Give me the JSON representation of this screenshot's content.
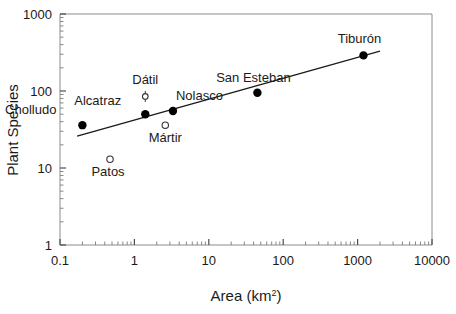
{
  "chart_data": {
    "type": "scatter",
    "title": "",
    "xlabel": "Area (km²)",
    "ylabel": "Plant Species",
    "xscale": "log",
    "yscale": "log",
    "xlim": [
      0.1,
      10000
    ],
    "ylim": [
      1,
      1000
    ],
    "xticks": [
      "0.1",
      "1",
      "10",
      "100",
      "1000",
      "10000"
    ],
    "yticks": [
      "1",
      "10",
      "100",
      "1000"
    ],
    "grid": false,
    "legend": "none",
    "points": [
      {
        "label": "Cholludo",
        "x": 0.2,
        "y": 36,
        "marker": "filled",
        "label_dx": -26,
        "label_dy": -11
      },
      {
        "label": "Patos",
        "x": 0.47,
        "y": 13,
        "marker": "open",
        "label_dx": -2,
        "label_dy": 17
      },
      {
        "label": "Dátil",
        "x": 1.4,
        "y": 85,
        "marker": "open-errorbar",
        "label_dx": 0,
        "label_dy": -12
      },
      {
        "label": "Alcatraz",
        "x": 1.4,
        "y": 50,
        "marker": "filled",
        "label_dx": -24,
        "label_dy": -9
      },
      {
        "label": "Mártir",
        "x": 2.6,
        "y": 36,
        "marker": "open",
        "label_dx": 0,
        "label_dy": 17
      },
      {
        "label": "Nolasco",
        "x": 3.3,
        "y": 55,
        "marker": "filled",
        "label_dx": 3,
        "label_dy": -11
      },
      {
        "label": "San Esteban",
        "x": 45,
        "y": 95,
        "marker": "filled",
        "label_dx": -4,
        "label_dy": -11
      },
      {
        "label": "Tiburón",
        "x": 1200,
        "y": 290,
        "marker": "filled",
        "label_dx": -4,
        "label_dy": -12
      }
    ],
    "fit_line": {
      "x_start": 0.17,
      "y_start": 26,
      "x_end": 2000,
      "y_end": 330
    },
    "colors": {
      "marker_filled": "#000000",
      "marker_open": "#ffffff",
      "line": "#1a1a1a",
      "axis": "#8c8c8c",
      "text": "#1a1a1a"
    }
  },
  "axis_titles": {
    "x_main": "Area (km",
    "x_sup": "2",
    "x_close": ")",
    "y": "Plant Species"
  }
}
